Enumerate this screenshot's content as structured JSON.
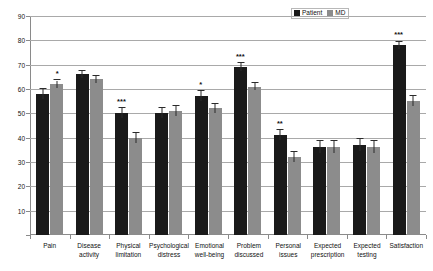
{
  "chart_data": {
    "type": "bar",
    "title": "",
    "xlabel": "",
    "ylabel": "",
    "ylim": [
      0,
      90
    ],
    "yticks": [
      0,
      10,
      20,
      30,
      40,
      50,
      60,
      70,
      80,
      90
    ],
    "ytick_labels": [
      "0",
      "10",
      "20",
      "30",
      "40",
      "50",
      "60",
      "70",
      "80",
      "90"
    ],
    "grid": true,
    "legend_position": "top-right",
    "categories": [
      "Pain",
      "Disease activity",
      "Physical limitation",
      "Psychological distress",
      "Emotional well-being",
      "Problem discussed",
      "Personal issues",
      "Expected prescription",
      "Expected testing",
      "Satisfaction"
    ],
    "category_lines": [
      [
        "Pain"
      ],
      [
        "Disease",
        "activity"
      ],
      [
        "Physical",
        "limitation"
      ],
      [
        "Psychological",
        "distress"
      ],
      [
        "Emotional",
        "well-being"
      ],
      [
        "Problem",
        "discussed"
      ],
      [
        "Personal",
        "issues"
      ],
      [
        "Expected",
        "prescription"
      ],
      [
        "Expected",
        "testing"
      ],
      [
        "Satisfaction"
      ]
    ],
    "series": [
      {
        "name": "Patient",
        "color": "#1a1a1a",
        "values": [
          58,
          66,
          50,
          50,
          57,
          69,
          41,
          36,
          37,
          78
        ],
        "errors": [
          2,
          1.5,
          2,
          2,
          2,
          1.5,
          2,
          2.5,
          2.5,
          1.5
        ]
      },
      {
        "name": "MD",
        "color": "#8c8c8c",
        "values": [
          62,
          64,
          40,
          51,
          52,
          61,
          32,
          36,
          36,
          55
        ],
        "errors": [
          1.5,
          1.5,
          2,
          2,
          2,
          1.5,
          2,
          2.5,
          2.5,
          2
        ]
      }
    ],
    "significance": [
      "*",
      "",
      "***",
      "",
      "*",
      "***",
      "**",
      "",
      "",
      "***"
    ]
  },
  "legend": {
    "entries": [
      {
        "label": "Patient",
        "swatch": "patient-swatch"
      },
      {
        "label": "MD",
        "swatch": "md-swatch"
      }
    ]
  }
}
